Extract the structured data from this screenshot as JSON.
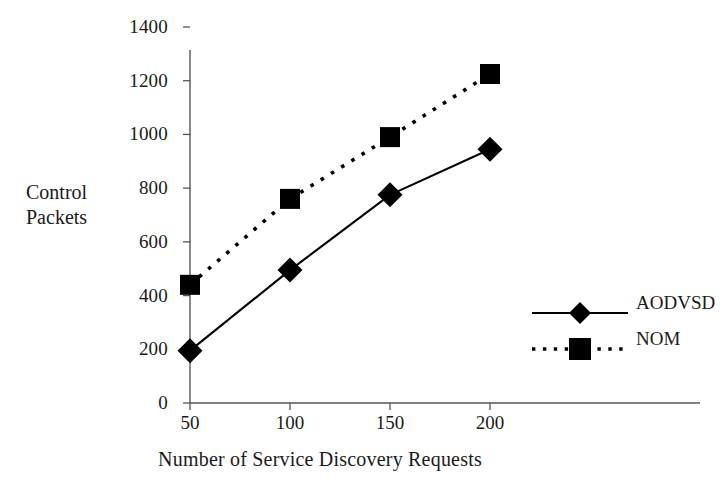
{
  "chart_data": {
    "type": "line",
    "title": "",
    "xlabel": "Number of Service Discovery Requests",
    "ylabel": "Control Packets",
    "x": [
      50,
      100,
      150,
      200
    ],
    "xticklabels": [
      "50",
      "100",
      "150",
      "200"
    ],
    "yticklabels": [
      "0",
      "200",
      "400",
      "600",
      "800",
      "1000",
      "1200",
      "1400"
    ],
    "ytickvalues": [
      0,
      200,
      400,
      600,
      800,
      1000,
      1200,
      1400
    ],
    "xlim": [
      50,
      200
    ],
    "ylim": [
      0,
      1400
    ],
    "grid": false,
    "legend_position": "right-middle",
    "series": [
      {
        "name": "AODVSD",
        "values": [
          195,
          495,
          775,
          945
        ],
        "line_style": "solid",
        "marker": "diamond",
        "color": "#000000"
      },
      {
        "name": "NOM",
        "values": [
          440,
          760,
          990,
          1225
        ],
        "line_style": "dotted",
        "marker": "square",
        "color": "#000000"
      }
    ]
  },
  "axis": {
    "y_title_line1": "Control",
    "y_title_line2": "Packets",
    "x_title": "Number of Service Discovery Requests",
    "y_ticks": [
      "1400",
      "1200",
      "1000",
      "800",
      "600",
      "400",
      "200",
      "0"
    ],
    "x_ticks": [
      "50",
      "100",
      "150",
      "200"
    ]
  },
  "legend": {
    "items": [
      {
        "label": "AODVSD",
        "marker": "diamond-marker",
        "line": "solid-line"
      },
      {
        "label": "NOM",
        "marker": "square-marker",
        "line": "dotted-line"
      }
    ]
  },
  "colors": {
    "ink": "#000000",
    "axis": "#4d4d4d",
    "background": "#ffffff"
  }
}
